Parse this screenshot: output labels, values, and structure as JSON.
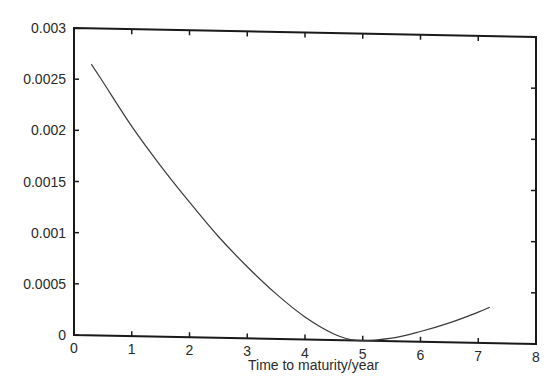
{
  "chart_data": {
    "type": "line",
    "title": "",
    "xlabel": "Time to maturity/year",
    "ylabel": "",
    "xlim": [
      0,
      8
    ],
    "ylim": [
      0,
      0.003
    ],
    "xticks": [
      "0",
      "1",
      "2",
      "3",
      "4",
      "5",
      "6",
      "7",
      "8"
    ],
    "yticks": [
      "0",
      "0.0005",
      "0.001",
      "0.0015",
      "0.002",
      "0.0025",
      "0.003"
    ],
    "grid": false,
    "legend": null,
    "series": [
      {
        "name": "curve",
        "x": [
          0.3,
          0.5,
          1.0,
          1.5,
          2.0,
          2.5,
          3.0,
          3.5,
          4.0,
          4.5,
          4.9,
          5.5,
          6.0,
          6.5,
          7.0,
          7.2
        ],
        "values": [
          0.00265,
          0.00248,
          0.00205,
          0.00167,
          0.00132,
          0.00099,
          0.0007,
          0.00044,
          0.00022,
          6e-05,
          0.0,
          3e-05,
          0.0001,
          0.00019,
          0.0003,
          0.00035
        ]
      }
    ],
    "colors": {
      "line": "#3a3a3a",
      "axes": "#1a1a1a",
      "background": "#ffffff"
    }
  }
}
